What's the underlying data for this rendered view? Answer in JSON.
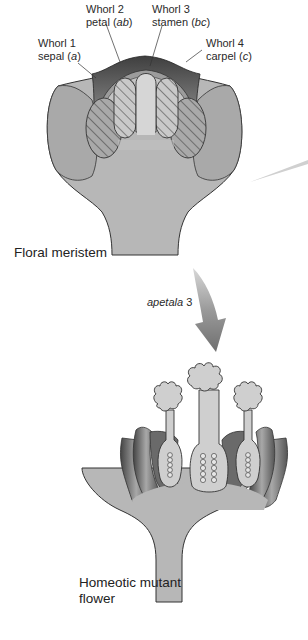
{
  "diagram": {
    "top_flower": {
      "name": "Floral meristem",
      "whorls": [
        {
          "line1": "Whorl 1",
          "organ": "sepal",
          "genes": "a"
        },
        {
          "line1": "Whorl 2",
          "organ": "petal",
          "genes": "ab"
        },
        {
          "line1": "Whorl 3",
          "organ": "stamen",
          "genes": "bc"
        },
        {
          "line1": "Whorl 4",
          "organ": "carpel",
          "genes": "c"
        }
      ]
    },
    "mutation": {
      "gene": "apetala",
      "number": "3"
    },
    "bottom_flower": {
      "line1": "Homeotic mutant",
      "line2": "flower"
    },
    "colors": {
      "tissue": "#b3b3b3",
      "tissue_light": "#cfcfcf",
      "dark_band": "#5a5a5a",
      "outline": "#333333",
      "arrow": "#8a8a8a"
    }
  }
}
